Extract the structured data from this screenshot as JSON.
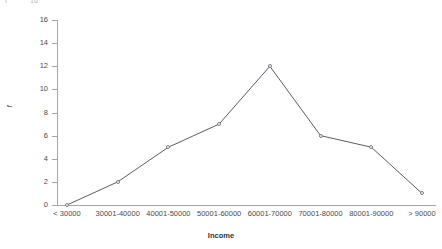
{
  "top_clipped_text": {
    "left_fragment": "f",
    "right_fragment": "16"
  },
  "chart_data": {
    "type": "line",
    "title": "",
    "subtitle": "",
    "xlabel": "Income",
    "ylabel": "f",
    "categories": [
      "< 30000",
      "30001-40000",
      "40001-50000",
      "50001-60000",
      "60001-70000",
      "70001-80000",
      "80001-90000",
      "> 90000"
    ],
    "values": [
      0,
      2,
      5,
      7,
      12,
      6,
      5,
      1
    ],
    "ylim": [
      0,
      16
    ],
    "ytick_values": [
      0,
      2,
      4,
      6,
      8,
      10,
      12,
      14,
      16
    ],
    "ytick_labels": [
      "0",
      "2",
      "4",
      "6",
      "8",
      "10",
      "12",
      "14",
      "16"
    ],
    "grid": false,
    "legend": false,
    "legend_position": "none",
    "marker": "open-circle",
    "line_color": "#5a5a6e",
    "marker_edge_color": "#7a7a88",
    "marker_fill_color": "#ffffff",
    "axis_color": "#a6a6a6",
    "background_color": "#ffffff"
  }
}
